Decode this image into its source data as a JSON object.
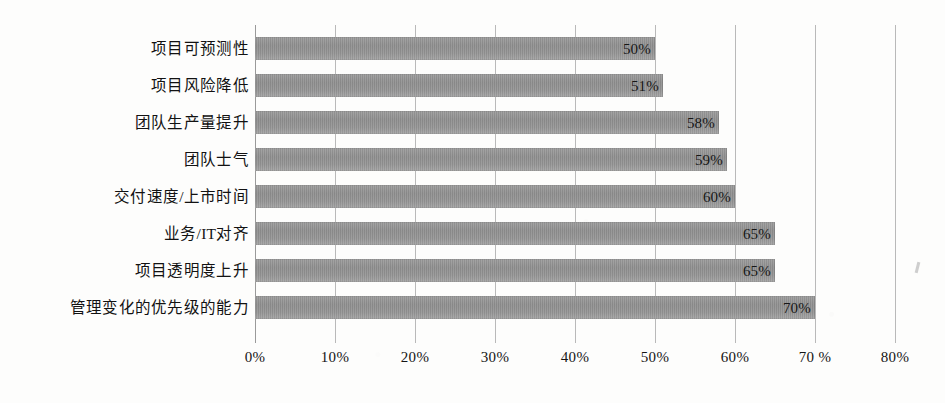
{
  "chart_data": {
    "type": "bar",
    "orientation": "horizontal",
    "title": "",
    "subtitle": "",
    "xlabel": "",
    "ylabel": "",
    "xlim": [
      0,
      80
    ],
    "grid": true,
    "legend": false,
    "legend_position": "none",
    "value_label_position": "inside-end",
    "bar_color": "#939393",
    "gridline_color": "#b9b9b9",
    "text_color": "#151515",
    "background": "#fdfdfc",
    "categories": [
      "项目可预测性",
      "项目风险降低",
      "团队生产量提升",
      "团队士气",
      "交付速度/上市时间",
      "业务/IT对齐",
      "项目透明度上升",
      "管理变化的优先级的能力"
    ],
    "values": [
      50,
      51,
      58,
      59,
      60,
      65,
      65,
      70
    ],
    "value_labels": [
      "50%",
      "51%",
      "58%",
      "59%",
      "60%",
      "65%",
      "65%",
      "70%"
    ],
    "xticks": [
      0,
      10,
      20,
      30,
      40,
      50,
      60,
      70,
      80
    ],
    "xtick_labels": [
      "0%",
      "10%",
      "20%",
      "30%",
      "40%",
      "50%",
      "60%",
      "70 %",
      "80%"
    ]
  }
}
